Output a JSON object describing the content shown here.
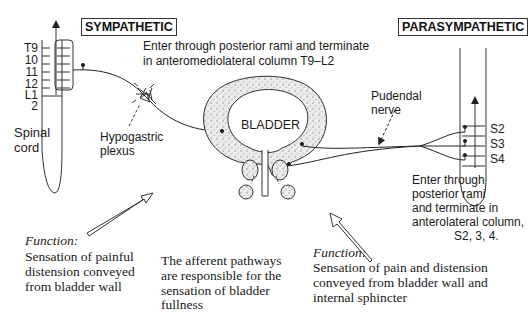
{
  "labels": {
    "sympathetic": "SYMPATHETIC",
    "parasympathetic": "PARASYMPATHETIC",
    "sympathetic_entry_line1": "Enter through posterior rami and terminate",
    "sympathetic_entry_line2": "in anteromediolateral column T9–L2",
    "spinal_cord_line1": "Spinal",
    "spinal_cord_line2": "cord",
    "hypogastric_line1": "Hypogastric",
    "hypogastric_line2": "plexus",
    "bladder": "BLADDER",
    "pudendal_line1": "Pudendal",
    "pudendal_line2": "nerve",
    "para_entry_line1": "Enter through",
    "para_entry_line2": "posterior rami",
    "para_entry_line3": "and terminate in",
    "para_entry_line4": "anterolateral column,",
    "para_entry_line5": "S2, 3, 4."
  },
  "sympathetic_segments": [
    "T9",
    "10",
    "11",
    "12",
    "L1",
    "2"
  ],
  "sacral_segments": [
    "S2",
    "S3",
    "S4"
  ],
  "captions": {
    "left": {
      "heading": "Function:",
      "line1": "Sensation of painful",
      "line2": "distension conveyed",
      "line3": "from bladder wall"
    },
    "center": {
      "line1": "The afferent pathways",
      "line2": "are responsible for the",
      "line3": "sensation of bladder",
      "line4": "fullness"
    },
    "right": {
      "heading": "Function:",
      "line1": "Sensation of pain and distension",
      "line2": "conveyed from bladder wall and",
      "line3": "internal sphincter"
    }
  }
}
